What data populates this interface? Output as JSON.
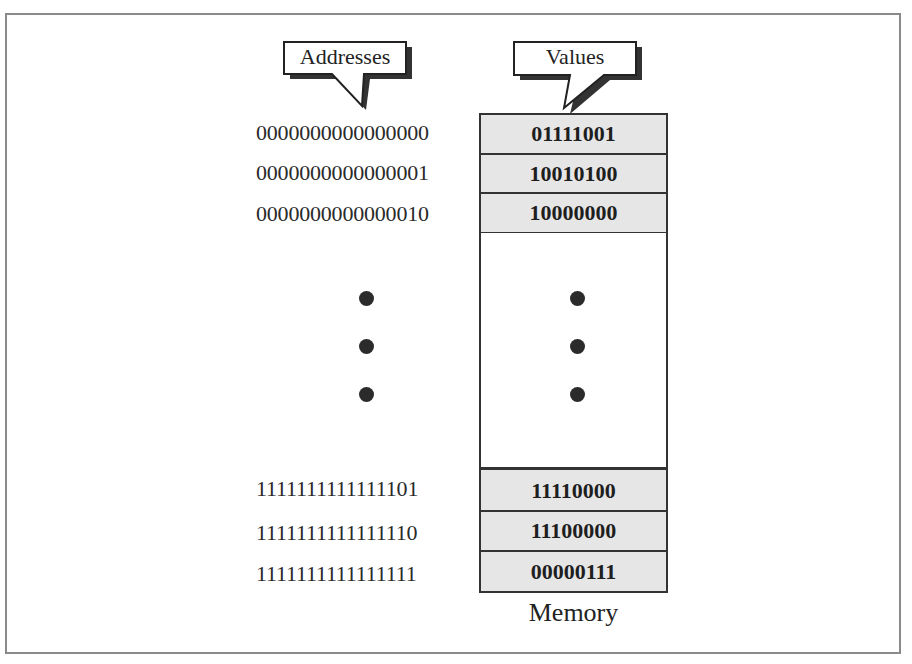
{
  "diagram": {
    "title": "Memory",
    "callouts": {
      "addresses": "Addresses",
      "values": "Values"
    },
    "rows_top": [
      {
        "address": "0000000000000000",
        "value": "01111001"
      },
      {
        "address": "0000000000000001",
        "value": "10010100"
      },
      {
        "address": "0000000000000010",
        "value": "10000000"
      }
    ],
    "rows_bottom": [
      {
        "address": "1111111111111101",
        "value": "11110000"
      },
      {
        "address": "1111111111111110",
        "value": "11100000"
      },
      {
        "address": "1111111111111111",
        "value": "00000111"
      }
    ],
    "ellipsis": "vertical-dots",
    "colors": {
      "cell_fill": "#e6e6e6",
      "border": "#333333",
      "frame": "#8a8a8a",
      "dot": "#2b2b2b"
    }
  }
}
